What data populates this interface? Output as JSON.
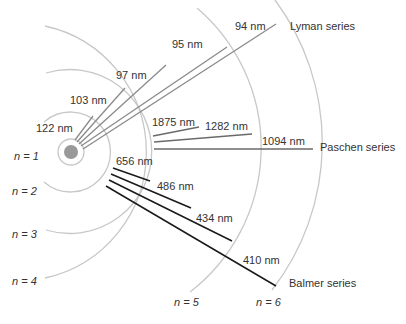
{
  "diagram": {
    "nucleus_color": "#999999",
    "orbits": [
      {
        "n": 1,
        "label": "n = 1"
      },
      {
        "n": 2,
        "label": "n = 2"
      },
      {
        "n": 3,
        "label": "n = 3"
      },
      {
        "n": 4,
        "label": "n = 4"
      },
      {
        "n": 5,
        "label": "n = 5"
      },
      {
        "n": 6,
        "label": "n = 6"
      }
    ],
    "series": {
      "lyman": {
        "name": "Lyman series",
        "transitions": [
          "122 nm",
          "103 nm",
          "97 nm",
          "95 nm",
          "94 nm"
        ]
      },
      "paschen": {
        "name": "Paschen series",
        "transitions": [
          "1875 nm",
          "1282 nm",
          "1094 nm"
        ]
      },
      "balmer": {
        "name": "Balmer series",
        "transitions": [
          "656 nm",
          "486 nm",
          "434 nm",
          "410 nm"
        ]
      }
    }
  }
}
